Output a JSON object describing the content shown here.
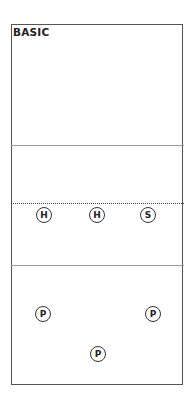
{
  "title": "BASIC",
  "court": {
    "lines": [
      {
        "type": "solid",
        "y": 145
      },
      {
        "type": "dotted",
        "y": 204
      },
      {
        "type": "solid",
        "y": 265
      }
    ]
  },
  "players": [
    {
      "label": "H",
      "x": 44,
      "y": 215
    },
    {
      "label": "H",
      "x": 97,
      "y": 215
    },
    {
      "label": "S",
      "x": 148,
      "y": 215
    },
    {
      "label": "P",
      "x": 43,
      "y": 314
    },
    {
      "label": "P",
      "x": 153,
      "y": 314
    },
    {
      "label": "P",
      "x": 98,
      "y": 354
    }
  ]
}
